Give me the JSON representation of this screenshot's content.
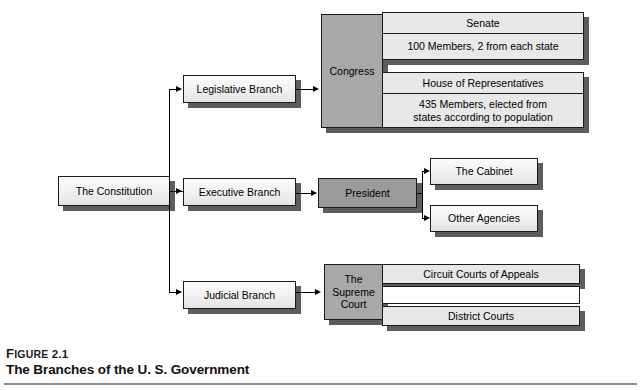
{
  "figure": {
    "label_small": "F",
    "label_rest": "IGURE",
    "number": "2.1",
    "title": "The Branches of the U. S. Government"
  },
  "diagram": {
    "root": {
      "label": "The Constitution"
    },
    "branches": [
      {
        "label": "Legislative Branch"
      },
      {
        "label": "Executive Branch"
      },
      {
        "label": "Judicial Branch"
      }
    ],
    "legislative": {
      "head": "Congress",
      "chambers": [
        {
          "title": "Senate",
          "detail": "100 Members, 2 from each state"
        },
        {
          "title": "House of Representatives",
          "detail": "435 Members, elected from\nstates according to population"
        }
      ]
    },
    "executive": {
      "head": "President",
      "children": [
        {
          "label": "The Cabinet"
        },
        {
          "label": "Other Agencies"
        }
      ]
    },
    "judicial": {
      "head": "The\nSupreme\nCourt",
      "children": [
        {
          "label": "Circuit Courts of Appeals"
        },
        {
          "label": "District Courts"
        }
      ]
    }
  },
  "colors": {
    "box_fill": "#e9e9e9",
    "box_fill_light": "#fbfbfb",
    "head_fill": "#a8a8a8",
    "shadow": "#5d5d5d",
    "line": "#000000",
    "rule": "#8d8d8d"
  }
}
